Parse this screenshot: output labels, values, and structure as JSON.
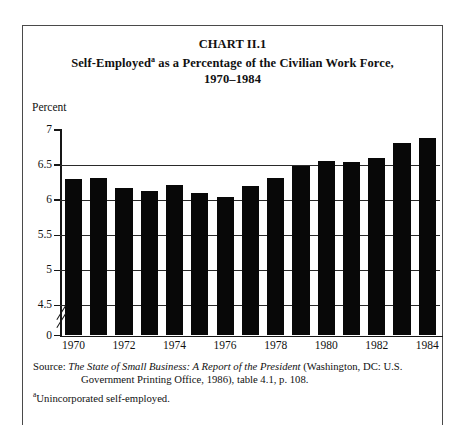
{
  "figure": {
    "chart_number": "CHART II.1",
    "title_main": "Self-Employed",
    "title_sup": "a",
    "title_rest": " as a Percentage of the Civilian Work Force,",
    "title_years": "1970–1984",
    "axis_unit_label": "Percent"
  },
  "notes": {
    "source_prefix": "Source: ",
    "source_italic": "The State of Small Business:  A Report of the President",
    "source_rest": " (Washington, DC:  U.S.",
    "source_line2": "Government Printing Office, 1986), table 4.1, p. 108.",
    "footnote_marker": "a",
    "footnote_text": "Unincorporated self-employed."
  },
  "chart_data": {
    "type": "bar",
    "xlabel": "",
    "ylabel": "Percent",
    "categories": [
      "1970",
      "1971",
      "1972",
      "1973",
      "1974",
      "1975",
      "1976",
      "1977",
      "1978",
      "1979",
      "1980",
      "1981",
      "1982",
      "1983",
      "1984"
    ],
    "values": [
      6.3,
      6.31,
      6.18,
      6.13,
      6.21,
      6.1,
      6.05,
      6.2,
      6.32,
      6.48,
      6.56,
      6.54,
      6.6,
      6.82,
      6.89
    ],
    "x_tick_labels": [
      "1970",
      "1972",
      "1974",
      "1976",
      "1978",
      "1980",
      "1982",
      "1984"
    ],
    "x_tick_categories": [
      "1970",
      "1972",
      "1974",
      "1976",
      "1978",
      "1980",
      "1982",
      "1984"
    ],
    "y_tick_labels": [
      "0",
      "4.5",
      "5",
      "5.5",
      "6",
      "6.5",
      "7"
    ],
    "y_tick_values": [
      0,
      4.5,
      5,
      5.5,
      6,
      6.5,
      7
    ],
    "ylim": [
      4.25,
      7
    ],
    "axis_break": true,
    "axis_break_between": [
      0,
      4.5
    ],
    "grid": true,
    "grid_axis": "y",
    "legend": "none",
    "bar_color": "#080808"
  }
}
